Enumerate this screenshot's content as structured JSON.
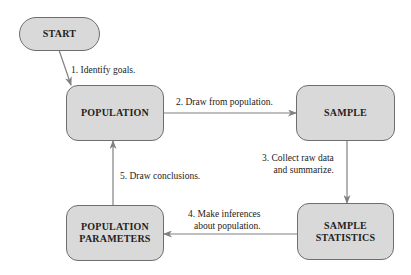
{
  "nodes": {
    "start": "START",
    "population": "POPULATION",
    "sample": "SAMPLE",
    "sample_statistics": [
      "SAMPLE",
      "STATISTICS"
    ],
    "population_parameters": [
      "POPULATION",
      "PARAMETERS"
    ]
  },
  "edges": {
    "step1": "1. Identify goals.",
    "step2": "2. Draw from population.",
    "step3": [
      "3. Collect raw data",
      "and summarize."
    ],
    "step4": [
      "4. Make inferences",
      "about population."
    ],
    "step5": "5. Draw conclusions."
  },
  "colors": {
    "node_fill": "#d9d9d9",
    "node_border": "#6e6e6e",
    "arrow": "#808080"
  }
}
